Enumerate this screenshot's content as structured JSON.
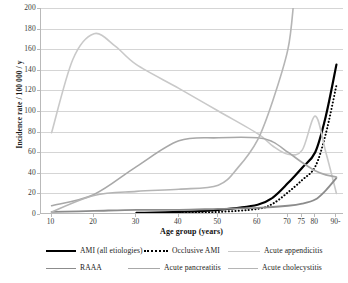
{
  "chart_data": {
    "type": "line",
    "title": "",
    "xlabel": "Age group (years)",
    "ylabel": "Incidence rate / 100 000 / y",
    "xtick_labels": [
      "10",
      "20",
      "30",
      "40",
      "50",
      "60",
      "70",
      "75",
      "80",
      "90-"
    ],
    "xtick_values": [
      10,
      20,
      30,
      40,
      50,
      60,
      70,
      75,
      80,
      90
    ],
    "ytick_labels": [
      "0",
      "20",
      "40",
      "60",
      "80",
      "100",
      "120",
      "140",
      "160",
      "180",
      "200"
    ],
    "ylim": [
      0,
      200
    ],
    "grid": "horizontal",
    "legend_position": "bottom",
    "series": [
      {
        "name": "AMI (all etiologies)",
        "color": "#000000",
        "style": "solid",
        "width": 2.2,
        "x": [
          30,
          40,
          50,
          60,
          65,
          70,
          75,
          80,
          85,
          90
        ],
        "values": [
          1,
          2,
          4,
          9,
          16,
          30,
          45,
          60,
          95,
          145
        ]
      },
      {
        "name": "Occlusive AMI",
        "color": "#000000",
        "style": "dotted",
        "width": 2.0,
        "x": [
          30,
          40,
          50,
          60,
          65,
          70,
          75,
          80,
          85,
          90
        ],
        "values": [
          0.5,
          1,
          2,
          5,
          10,
          21,
          33,
          46,
          78,
          125
        ]
      },
      {
        "name": "Acute appendicitis",
        "color": "#c9c9c9",
        "style": "solid",
        "width": 1.6,
        "x": [
          10,
          15,
          20,
          25,
          30,
          40,
          50,
          60,
          65,
          70,
          75,
          80,
          85,
          90
        ],
        "values": [
          79,
          150,
          175,
          163,
          145,
          122,
          100,
          78,
          66,
          58,
          62,
          95,
          60,
          20
        ]
      },
      {
        "name": "RAAA",
        "color": "#8c8c8c",
        "style": "solid",
        "width": 1.8,
        "x": [
          10,
          20,
          30,
          40,
          50,
          60,
          70,
          75,
          80,
          85,
          90
        ],
        "values": [
          2,
          3,
          4,
          4,
          5,
          6,
          8,
          10,
          14,
          23,
          35
        ]
      },
      {
        "name": "Acute pancreatitis",
        "color": "#a8a8a8",
        "style": "solid",
        "width": 1.6,
        "x": [
          10,
          20,
          30,
          40,
          50,
          60,
          65,
          70,
          75,
          80,
          85,
          90
        ],
        "values": [
          8,
          19,
          46,
          71,
          74,
          74,
          70,
          60,
          50,
          42,
          38,
          36
        ]
      },
      {
        "name": "Acute cholecystitis",
        "color": "#b5b5b5",
        "style": "solid",
        "width": 1.6,
        "x": [
          10,
          20,
          30,
          40,
          50,
          55,
          60,
          65,
          70,
          72
        ],
        "values": [
          2,
          18,
          22,
          24,
          28,
          45,
          72,
          110,
          160,
          205
        ]
      }
    ]
  },
  "legend": {
    "rows": [
      [
        {
          "label": "AMI (all etiologies)",
          "color": "#000000",
          "style": "solid",
          "width": 2.2,
          "x": 46,
          "swatch": 30
        },
        {
          "label": "Occlusive AMI",
          "color": "#000000",
          "style": "dotted",
          "width": 2.0,
          "x": 144,
          "swatch": 24
        },
        {
          "label": "Acute appendicitis",
          "color": "#c9c9c9",
          "style": "solid",
          "width": 1.6,
          "x": 228,
          "swatch": 32
        }
      ],
      [
        {
          "label": "RAAA",
          "color": "#8c8c8c",
          "style": "solid",
          "width": 1.8,
          "x": 46,
          "swatch": 30
        },
        {
          "label": "Acute pancreatitis",
          "color": "#a8a8a8",
          "style": "solid",
          "width": 1.6,
          "x": 128,
          "swatch": 32
        },
        {
          "label": "Acute cholecystitis",
          "color": "#b5b5b5",
          "style": "solid",
          "width": 1.6,
          "x": 228,
          "swatch": 30
        }
      ]
    ]
  }
}
